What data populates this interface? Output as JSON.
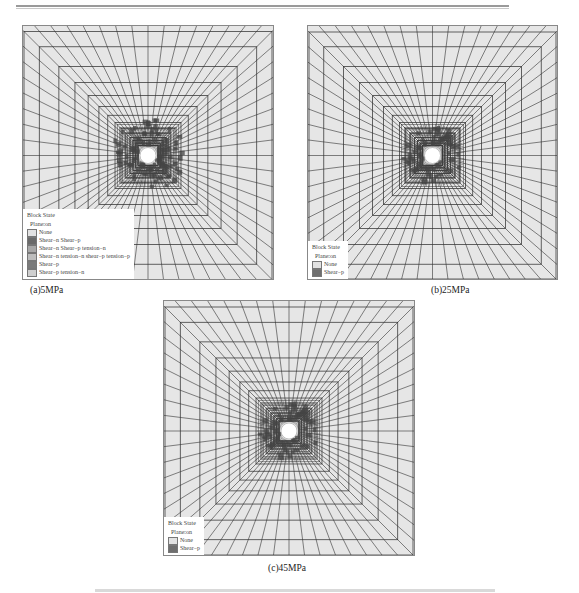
{
  "header": {
    "rule": true
  },
  "panels": [
    {
      "id": "a",
      "caption": "(a)5MPa",
      "legend": {
        "title": "Block State",
        "plane": "Plane:on",
        "items": [
          {
            "label": "None",
            "color": "#e2e2e2"
          },
          {
            "label": "Shear−n Shear−p",
            "color": "#6a6a6a"
          },
          {
            "label": "Shear−n Shear−p tension−n",
            "color": "#a8a8a8"
          },
          {
            "label": "Shear−n tension−n shear−p tension−p",
            "color": "#bdbdbd"
          },
          {
            "label": "Shear−p",
            "color": "#7a7a7a"
          },
          {
            "label": "Shear−p tension−n",
            "color": "#cfcfcf"
          }
        ]
      }
    },
    {
      "id": "b",
      "caption": "(b)25MPa",
      "legend": {
        "title": "Block State",
        "plane": "Plane:on",
        "items": [
          {
            "label": "None",
            "color": "#e2e2e2"
          },
          {
            "label": "Shear−p",
            "color": "#6e6e6e"
          }
        ]
      }
    },
    {
      "id": "c",
      "caption": "(c)45MPa",
      "legend": {
        "title": "Block State",
        "plane": "Plane:on",
        "items": [
          {
            "label": "None",
            "color": "#e2e2e2"
          },
          {
            "label": "Shear−p",
            "color": "#6e6e6e"
          }
        ]
      }
    }
  ],
  "colors": {
    "mesh_bg": "#e6e6e6",
    "mesh_line": "#333333",
    "damage": "#444444",
    "hole": "#ffffff"
  }
}
